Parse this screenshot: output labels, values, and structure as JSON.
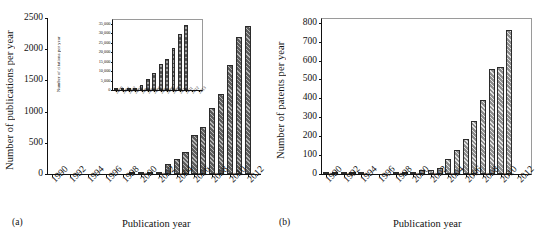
{
  "figure": {
    "panels": [
      {
        "tag": "(a)"
      },
      {
        "tag": "(b)"
      }
    ]
  },
  "chart_data": [
    {
      "type": "bar",
      "panel": "a",
      "title": "",
      "xlabel": "Publication year",
      "ylabel": "Number of publications per year",
      "ylim": [
        0,
        2500
      ],
      "yticks": [
        0,
        500,
        1000,
        1500,
        2000,
        2500
      ],
      "ytick_labels": [
        "0",
        "500",
        "1000",
        "1500",
        "2000",
        "2500"
      ],
      "xlim": [
        1989.5,
        2013.5
      ],
      "xtick_labels": [
        "1990",
        "1992",
        "1994",
        "1996",
        "1998",
        "2000",
        "2002",
        "2004",
        "2006",
        "2008",
        "2010",
        "2012"
      ],
      "grid": false,
      "legend": null,
      "categories": [
        1990,
        1991,
        1992,
        1993,
        1994,
        1995,
        1996,
        1997,
        1998,
        1999,
        2000,
        2001,
        2002,
        2003,
        2004,
        2005,
        2006,
        2007,
        2008,
        2009,
        2010,
        2011,
        2012,
        2013
      ],
      "values": [
        0,
        0,
        0,
        0,
        0,
        0,
        0,
        0,
        0,
        2,
        12,
        25,
        40,
        155,
        235,
        360,
        620,
        760,
        1050,
        1280,
        1740,
        2200,
        2380,
        0
      ]
    },
    {
      "type": "bar",
      "panel": "a-inset",
      "title": "",
      "xlabel": "",
      "ylabel": "Number of citations per year",
      "ylim": [
        0,
        37000
      ],
      "yticks": [
        0,
        5000,
        10000,
        15000,
        20000,
        25000,
        30000,
        35000
      ],
      "ytick_labels": [
        "0",
        "5,000",
        "10,000",
        "15,000",
        "20,000",
        "25,000",
        "30,000",
        "35,000"
      ],
      "xlim": [
        1999.5,
        2013.5
      ],
      "xtick_labels": [
        "2000",
        "2001",
        "2002",
        "2003",
        "2004",
        "2005",
        "2006",
        "2007",
        "2008",
        "2009",
        "2010",
        "2011",
        "2012",
        "2013"
      ],
      "grid": false,
      "legend": null,
      "categories": [
        2000,
        2001,
        2002,
        2003,
        2004,
        2005,
        2006,
        2007,
        2008,
        2009,
        2010,
        2011,
        2012,
        2013
      ],
      "values": [
        60,
        150,
        400,
        900,
        2900,
        5700,
        8800,
        13800,
        16500,
        22300,
        29700,
        34300,
        0,
        0
      ]
    },
    {
      "type": "bar",
      "panel": "b",
      "title": "",
      "xlabel": "Publication year",
      "ylabel": "Number of patents per year",
      "ylim": [
        0,
        820
      ],
      "yticks": [
        0,
        100,
        200,
        300,
        400,
        500,
        600,
        700,
        800
      ],
      "ytick_labels": [
        "0",
        "100",
        "200",
        "300",
        "400",
        "500",
        "600",
        "700",
        "800"
      ],
      "xlim": [
        1989.5,
        2013.5
      ],
      "xtick_labels": [
        "1990",
        "1992",
        "1994",
        "1996",
        "1998",
        "2000",
        "2002",
        "2004",
        "2006",
        "2008",
        "2010",
        "2012"
      ],
      "grid": false,
      "legend": null,
      "categories": [
        1990,
        1991,
        1992,
        1993,
        1994,
        1995,
        1996,
        1997,
        1998,
        1999,
        2000,
        2001,
        2002,
        2003,
        2004,
        2005,
        2006,
        2007,
        2008,
        2009,
        2010,
        2011,
        2012,
        2013
      ],
      "values": [
        2,
        1,
        1,
        1,
        1,
        0,
        0,
        0,
        1,
        1,
        8,
        20,
        22,
        32,
        78,
        128,
        183,
        280,
        389,
        553,
        568,
        760,
        0,
        0
      ]
    }
  ]
}
